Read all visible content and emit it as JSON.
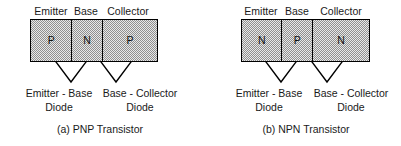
{
  "figures": [
    {
      "id": "pnp",
      "caption": "(a) PNP Transistor",
      "region_labels": [
        "Emitter",
        "Base",
        "Collector"
      ],
      "regions": [
        {
          "label": "Emitter",
          "type": "P"
        },
        {
          "label": "Base",
          "type": "N"
        },
        {
          "label": "Collector",
          "type": "P"
        }
      ],
      "junctions": [
        {
          "name": "emitter-base",
          "line1": "Emitter - Base",
          "line2": "Diode"
        },
        {
          "name": "base-collector",
          "line1": "Base - Collector",
          "line2": "Diode"
        }
      ]
    },
    {
      "id": "npn",
      "caption": "(b) NPN Transistor",
      "region_labels": [
        "Emitter",
        "Base",
        "Collector"
      ],
      "regions": [
        {
          "label": "Emitter",
          "type": "N"
        },
        {
          "label": "Base",
          "type": "P"
        },
        {
          "label": "Collector",
          "type": "N"
        }
      ],
      "junctions": [
        {
          "name": "emitter-base",
          "line1": "Emitter - Base",
          "line2": "Diode"
        },
        {
          "name": "base-collector",
          "line1": "Base - Collector",
          "line2": "Diode"
        }
      ]
    }
  ],
  "style": {
    "stroke_color": "#000000",
    "text_color": "#1a1a1a",
    "fill_pattern": "gray-dither-50"
  }
}
